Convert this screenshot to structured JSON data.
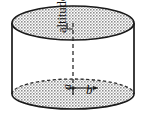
{
  "figure": {
    "name": "cylinder-geometry-figure",
    "shape": "cylinder",
    "labels": {
      "altitude": "altitude",
      "base_edge": "a",
      "radius": "b"
    },
    "colors": {
      "outline": "#1a1a1a",
      "fill_pattern": "#9a9a9a",
      "background": "#ffffff",
      "dash": "#2b2b2b"
    },
    "geometry": {
      "top_ellipse_cx": 73,
      "top_ellipse_cy": 23,
      "top_ellipse_rx": 61,
      "top_ellipse_ry": 17,
      "bottom_ellipse_cx": 73,
      "bottom_ellipse_cy": 94,
      "bottom_ellipse_rx": 61,
      "bottom_ellipse_ry": 15,
      "left_wall_x": 12,
      "right_wall_x": 134,
      "altitude_line_x": 73,
      "altitude_top_y": 23,
      "altitude_bottom_y": 94,
      "radius_arrow_from_x": 73,
      "radius_arrow_to_x": 100,
      "radius_arrow_y": 88
    },
    "markers": {
      "top_right_angle": "right-angle-marker",
      "bottom_right_angle": "right-angle-marker",
      "bottom_rim_style": "dashed"
    }
  }
}
